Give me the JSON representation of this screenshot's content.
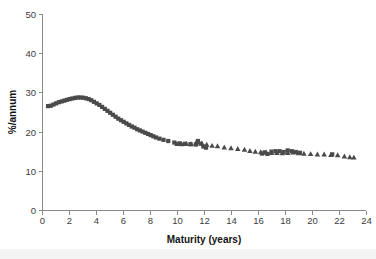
{
  "chart_data": {
    "type": "scatter",
    "title": "",
    "subtitle": "",
    "xlabel": "Maturity (years)",
    "ylabel": "%/annum",
    "xlim": [
      0,
      24
    ],
    "ylim": [
      0,
      50
    ],
    "xticks": [
      0,
      2,
      4,
      6,
      8,
      10,
      12,
      14,
      16,
      18,
      20,
      22,
      24
    ],
    "yticks": [
      0,
      10,
      20,
      30,
      40,
      50
    ],
    "xtick_labels": [
      "0",
      "2",
      "4",
      "6",
      "8",
      "10",
      "12",
      "14",
      "16",
      "18",
      "20",
      "22",
      "24"
    ],
    "ytick_labels": [
      "0",
      "10",
      "20",
      "30",
      "40",
      "50"
    ],
    "grid": false,
    "legend": "none",
    "marker_color": "#4a4a4a",
    "axis_color": "#8a8a8a",
    "background": "#ffffff",
    "series": [
      {
        "name": "square-series",
        "marker": "square",
        "marker_size": 4.2,
        "color": "#4a4a4a",
        "points": [
          [
            0.45,
            26.5
          ],
          [
            0.65,
            26.6
          ],
          [
            0.85,
            26.9
          ],
          [
            1.05,
            27.2
          ],
          [
            1.25,
            27.5
          ],
          [
            1.45,
            27.7
          ],
          [
            1.65,
            27.9
          ],
          [
            1.85,
            28.1
          ],
          [
            2.05,
            28.3
          ],
          [
            2.25,
            28.45
          ],
          [
            2.45,
            28.6
          ],
          [
            2.65,
            28.7
          ],
          [
            2.85,
            28.7
          ],
          [
            3.05,
            28.65
          ],
          [
            3.25,
            28.5
          ],
          [
            3.45,
            28.3
          ],
          [
            3.65,
            28.0
          ],
          [
            3.85,
            27.6
          ],
          [
            4.05,
            27.2
          ],
          [
            4.25,
            26.8
          ],
          [
            4.45,
            26.3
          ],
          [
            4.65,
            25.8
          ],
          [
            4.85,
            25.3
          ],
          [
            5.05,
            24.8
          ],
          [
            5.25,
            24.3
          ],
          [
            5.45,
            23.8
          ],
          [
            5.65,
            23.3
          ],
          [
            5.85,
            22.9
          ],
          [
            6.05,
            22.5
          ],
          [
            6.25,
            22.1
          ],
          [
            6.45,
            21.7
          ],
          [
            6.65,
            21.3
          ],
          [
            6.85,
            21.0
          ],
          [
            7.05,
            20.6
          ],
          [
            7.25,
            20.3
          ],
          [
            7.45,
            20.0
          ],
          [
            7.65,
            19.7
          ],
          [
            7.85,
            19.4
          ],
          [
            8.05,
            19.1
          ],
          [
            8.25,
            18.8
          ],
          [
            8.45,
            18.5
          ],
          [
            8.7,
            18.2
          ],
          [
            9.0,
            17.9
          ],
          [
            9.35,
            17.6
          ],
          [
            9.8,
            17.2
          ],
          [
            10.2,
            17.0
          ],
          [
            10.6,
            16.9
          ],
          [
            11.0,
            16.8
          ],
          [
            11.4,
            16.7
          ],
          [
            11.55,
            17.6
          ],
          [
            11.75,
            16.9
          ],
          [
            11.95,
            16.2
          ],
          [
            12.15,
            15.9
          ],
          [
            16.3,
            14.4
          ],
          [
            16.5,
            14.7
          ],
          [
            16.7,
            14.3
          ],
          [
            17.0,
            14.9
          ],
          [
            17.3,
            15.0
          ],
          [
            17.6,
            15.0
          ],
          [
            17.9,
            14.8
          ],
          [
            18.2,
            15.2
          ],
          [
            18.5,
            15.0
          ],
          [
            18.8,
            14.8
          ],
          [
            19.1,
            14.6
          ],
          [
            21.5,
            14.2
          ]
        ]
      },
      {
        "name": "triangle-series",
        "marker": "triangle",
        "marker_size": 5.2,
        "color": "#4a4a4a",
        "points": [
          [
            10.0,
            16.9
          ],
          [
            10.35,
            16.8
          ],
          [
            10.7,
            16.9
          ],
          [
            11.05,
            16.8
          ],
          [
            11.4,
            17.1
          ],
          [
            11.6,
            17.4
          ],
          [
            11.85,
            17.0
          ],
          [
            12.2,
            16.7
          ],
          [
            12.6,
            16.4
          ],
          [
            13.0,
            16.3
          ],
          [
            13.5,
            16.0
          ],
          [
            14.0,
            15.8
          ],
          [
            14.5,
            15.6
          ],
          [
            15.0,
            15.4
          ],
          [
            15.4,
            15.1
          ],
          [
            15.8,
            14.9
          ],
          [
            16.2,
            14.8
          ],
          [
            16.6,
            14.7
          ],
          [
            17.0,
            14.6
          ],
          [
            17.4,
            14.6
          ],
          [
            17.8,
            14.5
          ],
          [
            18.2,
            14.6
          ],
          [
            18.6,
            14.7
          ],
          [
            19.0,
            14.5
          ],
          [
            19.4,
            14.4
          ],
          [
            19.9,
            14.3
          ],
          [
            20.4,
            14.2
          ],
          [
            20.9,
            14.2
          ],
          [
            21.4,
            14.1
          ],
          [
            21.9,
            14.0
          ],
          [
            22.4,
            13.7
          ],
          [
            22.8,
            13.5
          ],
          [
            23.1,
            13.4
          ]
        ]
      }
    ]
  },
  "geometry": {
    "plot_left": 42,
    "plot_right": 366,
    "plot_top": 14,
    "plot_bottom": 210,
    "xlabel_x": 204,
    "xlabel_y": 243,
    "ylabel_x": 16,
    "ylabel_y": 112
  }
}
